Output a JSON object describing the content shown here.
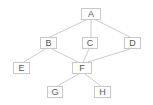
{
  "diagram": {
    "type": "directed-acyclic-graph",
    "colors": {
      "edge": "#cccccc",
      "node_border": "#c8c8c8",
      "text": "#555555"
    },
    "nodes": [
      {
        "id": "A",
        "label": "A",
        "x": 81,
        "y": 8,
        "w": 20,
        "h": 12
      },
      {
        "id": "B",
        "label": "B",
        "x": 40,
        "y": 37,
        "w": 17,
        "h": 12
      },
      {
        "id": "C",
        "label": "C",
        "x": 82,
        "y": 37,
        "w": 16,
        "h": 12
      },
      {
        "id": "D",
        "label": "D",
        "x": 124,
        "y": 37,
        "w": 17,
        "h": 12
      },
      {
        "id": "E",
        "label": "E",
        "x": 13,
        "y": 62,
        "w": 17,
        "h": 12
      },
      {
        "id": "F",
        "label": "F",
        "x": 72,
        "y": 62,
        "w": 20,
        "h": 12
      },
      {
        "id": "G",
        "label": "G",
        "x": 47,
        "y": 86,
        "w": 16,
        "h": 12
      },
      {
        "id": "H",
        "label": "H",
        "x": 94,
        "y": 86,
        "w": 17,
        "h": 12
      }
    ],
    "edges": [
      {
        "from": "A",
        "to": "B"
      },
      {
        "from": "A",
        "to": "C"
      },
      {
        "from": "A",
        "to": "D"
      },
      {
        "from": "B",
        "to": "E"
      },
      {
        "from": "B",
        "to": "F"
      },
      {
        "from": "C",
        "to": "F"
      },
      {
        "from": "D",
        "to": "F"
      },
      {
        "from": "F",
        "to": "G"
      },
      {
        "from": "F",
        "to": "H"
      }
    ]
  }
}
